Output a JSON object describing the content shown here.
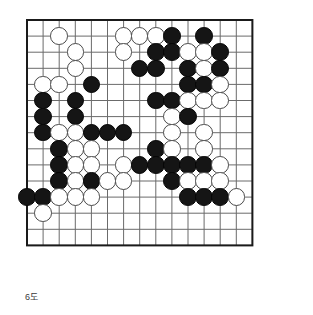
{
  "figure": {
    "caption": "6도",
    "kind": "go-board-diagram"
  },
  "board": {
    "columns": 15,
    "rows": 15,
    "line_color": "#6b6b6b",
    "border_color": "#1a1a1a",
    "background_color": "#ffffff",
    "black_stone_color": "#151515",
    "white_stone_color": "#ffffff",
    "white_stone_border_color": "#4a4a4a",
    "origin_x": 5,
    "origin_y": 5,
    "spacing": 16.1,
    "stone_diameter": 17.6
  },
  "chart_data": {
    "type": "table",
    "title": "6도",
    "xlabel": "",
    "ylabel": "",
    "grid": true,
    "legend": [
      {
        "name": "Black stone",
        "color": "#151515"
      },
      {
        "name": "White stone",
        "color": "#ffffff"
      }
    ],
    "categories": [
      "c0",
      "c1",
      "c2",
      "c3",
      "c4",
      "c5",
      "c6",
      "c7",
      "c8",
      "c9",
      "c10",
      "c11",
      "c12",
      "c13",
      "c14"
    ],
    "stones": [
      {
        "color": "white",
        "col": 2,
        "row": 1
      },
      {
        "color": "white",
        "col": 6,
        "row": 1
      },
      {
        "color": "white",
        "col": 7,
        "row": 1
      },
      {
        "color": "white",
        "col": 8,
        "row": 1
      },
      {
        "color": "black",
        "col": 9,
        "row": 1
      },
      {
        "color": "black",
        "col": 11,
        "row": 1
      },
      {
        "color": "white",
        "col": 3,
        "row": 2
      },
      {
        "color": "white",
        "col": 6,
        "row": 2
      },
      {
        "color": "black",
        "col": 8,
        "row": 2
      },
      {
        "color": "black",
        "col": 9,
        "row": 2
      },
      {
        "color": "white",
        "col": 10,
        "row": 2
      },
      {
        "color": "white",
        "col": 11,
        "row": 2
      },
      {
        "color": "black",
        "col": 12,
        "row": 2
      },
      {
        "color": "white",
        "col": 3,
        "row": 3
      },
      {
        "color": "black",
        "col": 7,
        "row": 3
      },
      {
        "color": "black",
        "col": 8,
        "row": 3
      },
      {
        "color": "black",
        "col": 10,
        "row": 3
      },
      {
        "color": "white",
        "col": 11,
        "row": 3
      },
      {
        "color": "black",
        "col": 12,
        "row": 3
      },
      {
        "color": "white",
        "col": 1,
        "row": 4
      },
      {
        "color": "white",
        "col": 2,
        "row": 4
      },
      {
        "color": "black",
        "col": 4,
        "row": 4
      },
      {
        "color": "black",
        "col": 10,
        "row": 4
      },
      {
        "color": "black",
        "col": 11,
        "row": 4
      },
      {
        "color": "white",
        "col": 12,
        "row": 4
      },
      {
        "color": "black",
        "col": 1,
        "row": 5
      },
      {
        "color": "black",
        "col": 3,
        "row": 5
      },
      {
        "color": "black",
        "col": 8,
        "row": 5
      },
      {
        "color": "black",
        "col": 9,
        "row": 5
      },
      {
        "color": "white",
        "col": 10,
        "row": 5
      },
      {
        "color": "white",
        "col": 11,
        "row": 5
      },
      {
        "color": "white",
        "col": 12,
        "row": 5
      },
      {
        "color": "black",
        "col": 1,
        "row": 6
      },
      {
        "color": "black",
        "col": 3,
        "row": 6
      },
      {
        "color": "white",
        "col": 9,
        "row": 6
      },
      {
        "color": "black",
        "col": 10,
        "row": 6
      },
      {
        "color": "black",
        "col": 1,
        "row": 7
      },
      {
        "color": "white",
        "col": 2,
        "row": 7
      },
      {
        "color": "white",
        "col": 3,
        "row": 7
      },
      {
        "color": "black",
        "col": 4,
        "row": 7
      },
      {
        "color": "black",
        "col": 5,
        "row": 7
      },
      {
        "color": "black",
        "col": 6,
        "row": 7
      },
      {
        "color": "white",
        "col": 9,
        "row": 7
      },
      {
        "color": "white",
        "col": 11,
        "row": 7
      },
      {
        "color": "black",
        "col": 2,
        "row": 8
      },
      {
        "color": "white",
        "col": 3,
        "row": 8
      },
      {
        "color": "white",
        "col": 4,
        "row": 8
      },
      {
        "color": "black",
        "col": 8,
        "row": 8
      },
      {
        "color": "white",
        "col": 9,
        "row": 8
      },
      {
        "color": "white",
        "col": 11,
        "row": 8
      },
      {
        "color": "black",
        "col": 2,
        "row": 9
      },
      {
        "color": "white",
        "col": 3,
        "row": 9
      },
      {
        "color": "white",
        "col": 4,
        "row": 9
      },
      {
        "color": "white",
        "col": 6,
        "row": 9
      },
      {
        "color": "black",
        "col": 7,
        "row": 9
      },
      {
        "color": "black",
        "col": 8,
        "row": 9
      },
      {
        "color": "black",
        "col": 9,
        "row": 9
      },
      {
        "color": "black",
        "col": 10,
        "row": 9
      },
      {
        "color": "black",
        "col": 11,
        "row": 9
      },
      {
        "color": "white",
        "col": 12,
        "row": 9
      },
      {
        "color": "black",
        "col": 2,
        "row": 10
      },
      {
        "color": "white",
        "col": 3,
        "row": 10
      },
      {
        "color": "black",
        "col": 4,
        "row": 10
      },
      {
        "color": "white",
        "col": 5,
        "row": 10
      },
      {
        "color": "white",
        "col": 6,
        "row": 10
      },
      {
        "color": "black",
        "col": 9,
        "row": 10
      },
      {
        "color": "white",
        "col": 10,
        "row": 10
      },
      {
        "color": "white",
        "col": 11,
        "row": 10
      },
      {
        "color": "white",
        "col": 12,
        "row": 10
      },
      {
        "color": "black",
        "col": 0,
        "row": 11
      },
      {
        "color": "black",
        "col": 1,
        "row": 11
      },
      {
        "color": "white",
        "col": 2,
        "row": 11
      },
      {
        "color": "white",
        "col": 3,
        "row": 11
      },
      {
        "color": "white",
        "col": 4,
        "row": 11
      },
      {
        "color": "black",
        "col": 10,
        "row": 11
      },
      {
        "color": "black",
        "col": 11,
        "row": 11
      },
      {
        "color": "black",
        "col": 12,
        "row": 11
      },
      {
        "color": "white",
        "col": 13,
        "row": 11
      },
      {
        "color": "white",
        "col": 1,
        "row": 12
      }
    ]
  }
}
